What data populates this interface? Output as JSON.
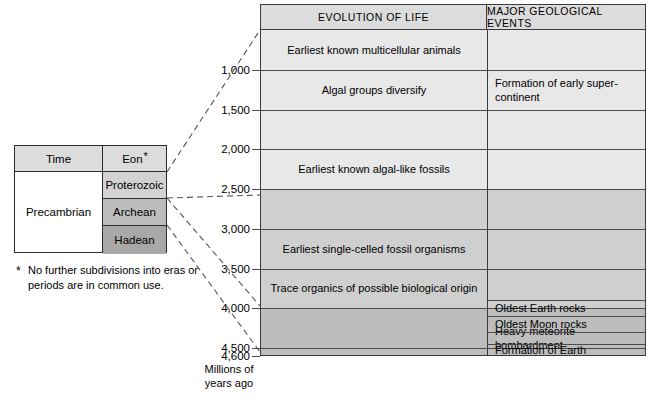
{
  "eon_table": {
    "headers": {
      "time": "Time",
      "eon": "Eon",
      "eon_asterisk": "*"
    },
    "period_label": "Precambrian",
    "eons": [
      {
        "label": "Proterozoic",
        "color": "#d2d2d2"
      },
      {
        "label": "Archean",
        "color": "#bdbdbd"
      },
      {
        "label": "Hadean",
        "color": "#a8a8a8"
      }
    ]
  },
  "footnote": {
    "marker": "*",
    "text": "No further subdivisions into eras or periods are in common use."
  },
  "chart_data": {
    "type": "table",
    "columns": [
      "EVOLUTION OF LIFE",
      "MAJOR GEOLOGICAL EVENTS"
    ],
    "axis": {
      "label": "Millions of years ago",
      "ticks": [
        "1,000",
        "1,500",
        "2,000",
        "2,500",
        "3,000",
        "3,500",
        "4,000",
        "4,500",
        "4,600"
      ],
      "tick_values": [
        1000,
        1500,
        2000,
        2500,
        3000,
        3500,
        4000,
        4500,
        4600
      ],
      "range": [
        500,
        4600
      ],
      "direction": "increasing-downward"
    },
    "bands": [
      {
        "eon": "Proterozoic",
        "from": 500,
        "to": 2500,
        "color": "#e8e8e8"
      },
      {
        "eon": "Archean",
        "from": 2500,
        "to": 4000,
        "color": "#cfcfcf"
      },
      {
        "eon": "Hadean",
        "from": 4000,
        "to": 4600,
        "color": "#bdbdbd"
      }
    ],
    "evolution_of_life": [
      {
        "text": "Earliest known multicellular animals",
        "from": 500,
        "to": 1000
      },
      {
        "text": "Algal groups diversify",
        "from": 1000,
        "to": 1500
      },
      {
        "text": "",
        "from": 1500,
        "to": 2000
      },
      {
        "text": "Earliest known algal-like fossils",
        "from": 2000,
        "to": 2500
      },
      {
        "text": "",
        "from": 2500,
        "to": 3000
      },
      {
        "text": "Earliest single-celled fossil organisms",
        "from": 3000,
        "to": 3500
      },
      {
        "text": "Trace organics of possible biological origin",
        "from": 3500,
        "to": 4000
      },
      {
        "text": "",
        "from": 4000,
        "to": 4500
      },
      {
        "text": "",
        "from": 4500,
        "to": 4600
      }
    ],
    "major_geological_events": [
      {
        "text": "Formation of early super-continent",
        "from": 1000,
        "to": 1500
      },
      {
        "text": "Oldest Earth rocks",
        "from": 3900,
        "to": 4100
      },
      {
        "text": "Oldest Moon rocks",
        "from": 4100,
        "to": 4300
      },
      {
        "text": "Heavy meteorite bombardment",
        "from": 4300,
        "to": 4450
      },
      {
        "text": "Formation of Earth",
        "from": 4450,
        "to": 4600
      }
    ]
  }
}
